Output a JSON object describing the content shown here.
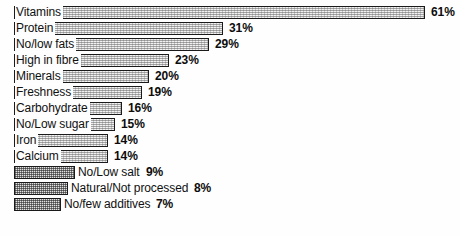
{
  "chart_data": {
    "type": "bar",
    "orientation": "horizontal",
    "title": "",
    "subtitle": "",
    "xlabel": "",
    "ylabel": "",
    "xlim": [
      0,
      61
    ],
    "grid": false,
    "legend": null,
    "value_suffix": "%",
    "categories": [
      "Vitamins",
      "Protein",
      "No/low fats",
      "High in fibre",
      "Minerals",
      "Freshness",
      "Carbohydrate",
      "No/Low sugar",
      "Iron",
      "Calcium",
      "No/Low salt",
      "Natural/Not processed",
      "No/few additives"
    ],
    "values": [
      61,
      31,
      29,
      23,
      20,
      19,
      16,
      15,
      14,
      14,
      9,
      8,
      7
    ],
    "value_labels": [
      "61%",
      "31%",
      "29%",
      "23%",
      "20%",
      "19%",
      "16%",
      "15%",
      "14%",
      "14%",
      "9%",
      "8%",
      "7%"
    ],
    "bars": [
      {
        "category": "Vitamins",
        "value": 61,
        "value_label": "61%",
        "label_inside": true
      },
      {
        "category": "Protein",
        "value": 31,
        "value_label": "31%",
        "label_inside": true
      },
      {
        "category": "No/low fats",
        "value": 29,
        "value_label": "29%",
        "label_inside": true
      },
      {
        "category": "High in fibre",
        "value": 23,
        "value_label": "23%",
        "label_inside": true
      },
      {
        "category": "Minerals",
        "value": 20,
        "value_label": "20%",
        "label_inside": true
      },
      {
        "category": "Freshness",
        "value": 19,
        "value_label": "19%",
        "label_inside": true
      },
      {
        "category": "Carbohydrate",
        "value": 16,
        "value_label": "16%",
        "label_inside": true
      },
      {
        "category": "No/Low sugar",
        "value": 15,
        "value_label": "15%",
        "label_inside": true
      },
      {
        "category": "Iron",
        "value": 14,
        "value_label": "14%",
        "label_inside": true
      },
      {
        "category": "Calcium",
        "value": 14,
        "value_label": "14%",
        "label_inside": true
      },
      {
        "category": "No/Low salt",
        "value": 9,
        "value_label": "9%",
        "label_inside": false
      },
      {
        "category": "Natural/Not processed",
        "value": 8,
        "value_label": "8%",
        "label_inside": false
      },
      {
        "category": "No/few additives",
        "value": 7,
        "value_label": "7%",
        "label_inside": false
      }
    ]
  },
  "style": {
    "bar_outline_color": "#1a1a1a",
    "bar_fill_color": "#f1f1f1",
    "text_color": "#101010",
    "background_color": "#fefefe"
  },
  "geometry": {
    "bar_left_px": 14,
    "bar_height_px": 13,
    "row_pitch_px": 16,
    "first_row_top_px": 6,
    "px_per_percent": 6.74,
    "value_gap_px": 6
  }
}
